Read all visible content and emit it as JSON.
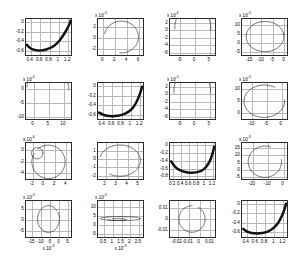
{
  "figure": {
    "title": "",
    "layout": "4x4 subplot grid",
    "background": "#ffffff",
    "axis_color": "#2b2b2b",
    "grid_color": "#b8b8b8",
    "curve_color": "#111111"
  },
  "chart_data": [
    {
      "id": "panel-r1c1",
      "type": "line",
      "title": "",
      "xlabel": "",
      "ylabel": "",
      "grid": true,
      "x_exponent": "",
      "y_exponent": "",
      "xticks": [
        "0.4",
        "0.6",
        "0.8",
        "1",
        "1.2"
      ],
      "yticks": [
        "0",
        "-0.2",
        "-0.4",
        "-0.6"
      ],
      "xlim": [
        0.3,
        1.3
      ],
      "ylim": [
        -0.72,
        0.06
      ],
      "shape": "thick-u-curve",
      "series": [
        {
          "name": "locus",
          "x": [
            0.32,
            0.38,
            0.45,
            0.55,
            0.65,
            0.75,
            0.85,
            0.95,
            1.05,
            1.15,
            1.22,
            1.27,
            1.29
          ],
          "y": [
            -0.5,
            -0.56,
            -0.6,
            -0.62,
            -0.62,
            -0.6,
            -0.56,
            -0.5,
            -0.4,
            -0.26,
            -0.14,
            -0.04,
            0.02
          ]
        }
      ]
    },
    {
      "id": "panel-r1c2",
      "type": "line",
      "title": "",
      "xlabel": "",
      "ylabel": "",
      "grid": true,
      "x_exponent": "",
      "y_exponent": "x 10-3",
      "xticks": [
        "0",
        "2",
        "4",
        "6"
      ],
      "yticks": [
        "2",
        "0",
        "-2"
      ],
      "xlim": [
        -0.9,
        7.0
      ],
      "ylim": [
        -3.4,
        3.4
      ],
      "shape": "open-circle-gap-bottom-left",
      "series": [
        {
          "name": "nyquist-loop",
          "cx": 3.2,
          "cy": 0.0,
          "r": 3.0,
          "start_deg": 168,
          "end_deg": -95
        }
      ]
    },
    {
      "id": "panel-r1c3",
      "type": "line",
      "title": "",
      "xlabel": "",
      "ylabel": "",
      "grid": true,
      "x_exponent": "x 10-5",
      "y_exponent": "x 10-6",
      "xticks": [
        "-5",
        "0",
        "5"
      ],
      "yticks": [
        "2",
        "0",
        "-2",
        "-4",
        "-6"
      ],
      "xlim": [
        -8.5,
        7.5
      ],
      "ylim": [
        -7.2,
        3.0
      ],
      "shape": "deep-u-arc",
      "series": [
        {
          "name": "locus",
          "cx": -0.4,
          "cy": 0.4,
          "r": 6.4,
          "start_deg": 182,
          "end_deg": -6
        }
      ]
    },
    {
      "id": "panel-r1c4",
      "type": "line",
      "title": "",
      "xlabel": "",
      "ylabel": "",
      "grid": true,
      "x_exponent": "",
      "y_exponent": "x 10-3",
      "xticks": [
        "-15",
        "-10",
        "-5",
        "0"
      ],
      "yticks": [
        "10",
        "5",
        "0",
        "-5"
      ],
      "xlim": [
        -18.5,
        2.0
      ],
      "ylim": [
        -7.5,
        13.0
      ],
      "shape": "open-circle-gap-right",
      "series": [
        {
          "name": "nyquist-loop",
          "cx": -8.0,
          "cy": 3.0,
          "r": 8.6,
          "start_deg": 12,
          "end_deg": -352
        }
      ]
    },
    {
      "id": "panel-r2c1",
      "type": "line",
      "title": "",
      "xlabel": "",
      "ylabel": "",
      "grid": true,
      "x_exponent": "x 10-6",
      "y_exponent": "x 10-4",
      "xticks": [
        "0",
        "5",
        "10"
      ],
      "yticks": [
        "0",
        "-5",
        "-10"
      ],
      "xlim": [
        -2.5,
        13.0
      ],
      "ylim": [
        -11.5,
        2.2
      ],
      "shape": "deep-u-arc",
      "series": [
        {
          "name": "locus",
          "cx": 5.0,
          "cy": 0.2,
          "r": 7.2,
          "start_deg": 176,
          "end_deg": -3
        }
      ]
    },
    {
      "id": "panel-r2c2",
      "type": "line",
      "title": "",
      "xlabel": "",
      "ylabel": "",
      "grid": true,
      "x_exponent": "",
      "y_exponent": "",
      "xticks": [
        "0.4",
        "0.6",
        "0.8",
        "1",
        "1.2"
      ],
      "yticks": [
        "0",
        "-0.2",
        "-0.4",
        "-0.6"
      ],
      "xlim": [
        0.3,
        1.3
      ],
      "ylim": [
        -0.72,
        0.06
      ],
      "shape": "thick-u-curve",
      "series": [
        {
          "name": "locus",
          "x": [
            0.32,
            0.4,
            0.5,
            0.62,
            0.74,
            0.86,
            0.98,
            1.08,
            1.16,
            1.23,
            1.28
          ],
          "y": [
            -0.58,
            -0.62,
            -0.65,
            -0.66,
            -0.65,
            -0.62,
            -0.56,
            -0.47,
            -0.34,
            -0.18,
            -0.02
          ]
        }
      ]
    },
    {
      "id": "panel-r2c3",
      "type": "line",
      "title": "",
      "xlabel": "",
      "ylabel": "",
      "grid": true,
      "x_exponent": "x 10-5",
      "y_exponent": "x 10-5",
      "xticks": [
        "-5",
        "0",
        "5"
      ],
      "yticks": [
        "2",
        "0",
        "-2",
        "-4",
        "-6"
      ],
      "xlim": [
        -8.5,
        7.5
      ],
      "ylim": [
        -7.2,
        3.0
      ],
      "shape": "deep-u-arc",
      "series": [
        {
          "name": "locus",
          "cx": -0.6,
          "cy": 0.6,
          "r": 6.5,
          "start_deg": 184,
          "end_deg": -4
        }
      ]
    },
    {
      "id": "panel-r2c4",
      "type": "line",
      "title": "",
      "xlabel": "",
      "ylabel": "",
      "grid": true,
      "x_exponent": "x 10-3",
      "y_exponent": "x 10-3",
      "xticks": [
        "-10",
        "-5",
        "0"
      ],
      "yticks": [
        "10",
        "5",
        "0"
      ],
      "xlim": [
        -13.5,
        2.5
      ],
      "ylim": [
        -3.5,
        12.5
      ],
      "shape": "open-circle-gap-bottom-right",
      "series": [
        {
          "name": "nyquist-loop",
          "cx": -5.6,
          "cy": 4.4,
          "r": 7.2,
          "start_deg": 5,
          "end_deg": -300
        }
      ]
    },
    {
      "id": "panel-r3c1",
      "type": "line",
      "title": "",
      "xlabel": "",
      "ylabel": "",
      "grid": true,
      "x_exponent": "x 10-6",
      "y_exponent": "x 10-6",
      "xticks": [
        "-2",
        "0",
        "2",
        "4"
      ],
      "yticks": [
        "0",
        "-2",
        "-4"
      ],
      "xlim": [
        -3.2,
        5.2
      ],
      "ylim": [
        -5.4,
        1.3
      ],
      "shape": "two-nested-circles",
      "series": [
        {
          "name": "small-loop",
          "cx": -1.1,
          "cy": -0.6,
          "r": 1.05,
          "start_deg": 0,
          "end_deg": 360
        },
        {
          "name": "large-loop",
          "cx": 1.0,
          "cy": -2.2,
          "r": 3.1,
          "start_deg": 130,
          "end_deg": -210
        }
      ]
    },
    {
      "id": "panel-r3c2",
      "type": "line",
      "title": "",
      "xlabel": "",
      "ylabel": "",
      "grid": true,
      "x_exponent": "x 10-2",
      "y_exponent": "",
      "xticks": [
        "2",
        "3",
        "4",
        "5"
      ],
      "yticks": [
        "1",
        "0",
        "-1",
        "-2"
      ],
      "xlim": [
        1.3,
        5.6
      ],
      "ylim": [
        -2.6,
        1.9
      ],
      "shape": "open-circle-gap-bottom-left",
      "series": [
        {
          "name": "nyquist-loop",
          "cx": 3.4,
          "cy": -0.3,
          "r": 1.95,
          "start_deg": 165,
          "end_deg": -120
        }
      ]
    },
    {
      "id": "panel-r3c3",
      "type": "line",
      "title": "",
      "xlabel": "",
      "ylabel": "",
      "grid": true,
      "x_exponent": "",
      "y_exponent": "",
      "xticks": [
        "0.2",
        "0.4",
        "0.6",
        "0.8",
        "1",
        "1.2"
      ],
      "yticks": [
        "0",
        "-0.2",
        "-0.4",
        "-0.6",
        "-0.8"
      ],
      "xlim": [
        0.12,
        1.3
      ],
      "ylim": [
        -0.92,
        0.06
      ],
      "shape": "thick-u-curve",
      "series": [
        {
          "name": "locus",
          "x": [
            0.15,
            0.25,
            0.38,
            0.52,
            0.66,
            0.8,
            0.94,
            1.06,
            1.16,
            1.23,
            1.28
          ],
          "y": [
            -0.44,
            -0.58,
            -0.68,
            -0.73,
            -0.75,
            -0.74,
            -0.7,
            -0.6,
            -0.44,
            -0.24,
            -0.04
          ]
        }
      ]
    },
    {
      "id": "panel-r3c4",
      "type": "line",
      "title": "",
      "xlabel": "",
      "ylabel": "",
      "grid": true,
      "x_exponent": "",
      "y_exponent": "x 10-3",
      "xticks": [
        "-20",
        "-10",
        "0"
      ],
      "yticks": [
        "15",
        "10",
        "5",
        "0",
        "-5"
      ],
      "xlim": [
        -27.0,
        3.5
      ],
      "ylim": [
        -7.5,
        18.5
      ],
      "shape": "open-circle-gap-bottom-right",
      "series": [
        {
          "name": "nyquist-loop",
          "cx": -11.5,
          "cy": 5.0,
          "r": 11.3,
          "start_deg": 8,
          "end_deg": -290
        }
      ]
    },
    {
      "id": "panel-r4c1",
      "type": "line",
      "title": "",
      "xlabel": "x 10-3",
      "ylabel": "",
      "grid": true,
      "x_exponent": "x 10-3",
      "y_exponent": "x 10-3",
      "xticks": [
        "-15",
        "-10",
        "-5",
        "0",
        "5"
      ],
      "yticks": [
        "5",
        "0",
        "-5"
      ],
      "xlim": [
        -18.5,
        7.5
      ],
      "ylim": [
        -8.5,
        8.5
      ],
      "shape": "c-shaped-spiral",
      "series": [
        {
          "name": "spiral",
          "cx": -5.5,
          "cy": 0.0,
          "r": 6.3,
          "start_deg": 30,
          "end_deg": -320
        }
      ]
    },
    {
      "id": "panel-r4c2",
      "type": "line",
      "title": "",
      "xlabel": "x 10-3",
      "ylabel": "",
      "grid": true,
      "x_exponent": "x 10-3",
      "y_exponent": "x 10-3",
      "xticks": [
        "0.5",
        "1",
        "1.5",
        "2",
        "2.5"
      ],
      "yticks": [
        "10",
        "5",
        "0",
        "-5"
      ],
      "xlim": [
        0.15,
        2.85
      ],
      "ylim": [
        -8.0,
        13.5
      ],
      "shape": "inward-spiral",
      "series": [
        {
          "name": "spiral-outer",
          "cx": 1.5,
          "cy": 3.0,
          "r": 1.2,
          "start_deg": 20,
          "end_deg": -330
        },
        {
          "name": "spiral-inner",
          "cx": 1.3,
          "cy": 2.4,
          "r": 0.55,
          "start_deg": 120,
          "end_deg": -180
        }
      ]
    },
    {
      "id": "panel-r4c3",
      "type": "line",
      "title": "",
      "xlabel": "",
      "ylabel": "",
      "grid": true,
      "x_exponent": "",
      "y_exponent": "",
      "xticks": [
        "-0.02",
        "-0.01",
        "0",
        "0.01"
      ],
      "yticks": [
        "0.01",
        "0",
        "-0.01"
      ],
      "xlim": [
        -0.027,
        0.016
      ],
      "ylim": [
        -0.018,
        0.016
      ],
      "shape": "open-circle-gap-bottom-right",
      "series": [
        {
          "name": "nyquist-loop",
          "cx": -0.006,
          "cy": -0.001,
          "r": 0.0125,
          "start_deg": 60,
          "end_deg": -270
        }
      ]
    },
    {
      "id": "panel-r4c4",
      "type": "line",
      "title": "",
      "xlabel": "",
      "ylabel": "",
      "grid": true,
      "x_exponent": "",
      "y_exponent": "",
      "xticks": [
        "0.4",
        "0.6",
        "0.8",
        "1",
        "1.2"
      ],
      "yticks": [
        "0",
        "-0.2",
        "-0.4",
        "-0.6"
      ],
      "xlim": [
        0.3,
        1.32
      ],
      "ylim": [
        -0.74,
        0.06
      ],
      "shape": "thick-u-curve",
      "series": [
        {
          "name": "locus",
          "x": [
            0.33,
            0.42,
            0.52,
            0.64,
            0.76,
            0.88,
            1.0,
            1.1,
            1.18,
            1.25,
            1.3
          ],
          "y": [
            -0.56,
            -0.62,
            -0.65,
            -0.66,
            -0.65,
            -0.62,
            -0.55,
            -0.45,
            -0.32,
            -0.16,
            0.0
          ]
        }
      ]
    }
  ]
}
